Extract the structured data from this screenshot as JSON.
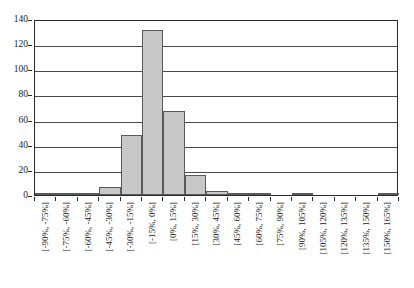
{
  "chart_data": {
    "type": "bar",
    "title": "",
    "subtitle": "",
    "xlabel": "",
    "ylabel": "",
    "ylim": [
      0,
      140
    ],
    "ytick_step": 20,
    "yticks": [
      0,
      20,
      40,
      60,
      80,
      100,
      120,
      140
    ],
    "ytick_labels": [
      "0",
      "20",
      "40",
      "60",
      "80",
      "100",
      "120",
      "140"
    ],
    "grid": true,
    "grid_axis": "y",
    "legend": false,
    "legend_position": "none",
    "annotations": [],
    "bar_fill_color": "#c8c8c8",
    "bar_edge_color": "#5a5a5a",
    "axis_color": "#2b2b2b",
    "grid_color": "#4a4a4a",
    "background_color": "#ffffff",
    "categories": [
      "[-90%, -75%]",
      "[-75%, -60%]",
      "[-60%, -45%]",
      "[-45%, -30%]",
      "[-30%, -15%]",
      "[-15%, 0%]",
      "[0%, 15%]",
      "[15%, 30%]",
      "[30%, 45%]",
      "[45%, 60%]",
      "[60%, 75%]",
      "[75%, 90%]",
      "[90%, 105%]",
      "[105%, 120%]",
      "[120%, 135%]",
      "[135%, 150%]",
      "[150%, 165%]"
    ],
    "values": [
      1,
      1,
      2,
      6,
      48,
      131,
      67,
      16,
      3,
      1,
      1,
      0,
      1,
      0,
      0,
      0,
      1
    ]
  }
}
